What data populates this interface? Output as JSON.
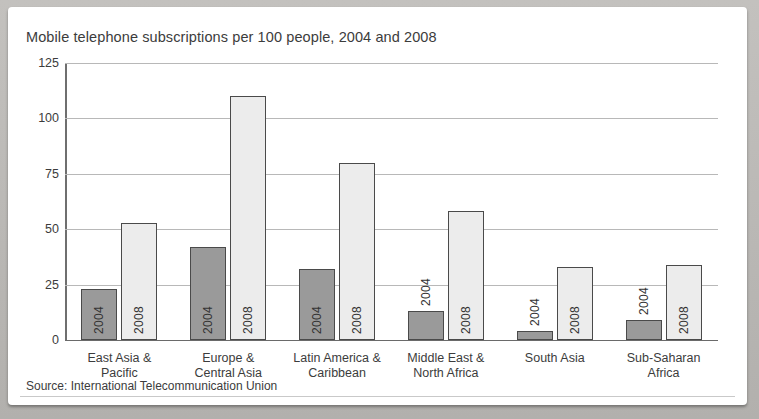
{
  "chart_data": {
    "type": "bar",
    "title": "Mobile telephone subscriptions per 100 people, 2004 and 2008",
    "xlabel": "",
    "ylabel": "",
    "ylim": [
      0,
      125
    ],
    "yticks": [
      0,
      25,
      50,
      75,
      100,
      125
    ],
    "grid": true,
    "legend_position": "none",
    "series_labels_on_bars": true,
    "categories": [
      "East Asia &\nPacific",
      "Europe &\nCentral Asia",
      "Latin America &\nCaribbean",
      "Middle East &\nNorth Africa",
      "South Asia",
      "Sub-Saharan\nAfrica"
    ],
    "category_lines": [
      [
        "East Asia &",
        "Pacific"
      ],
      [
        "Europe &",
        "Central Asia"
      ],
      [
        "Latin America &",
        "Caribbean"
      ],
      [
        "Middle East &",
        "North Africa"
      ],
      [
        "South Asia",
        ""
      ],
      [
        "Sub-Saharan",
        "Africa"
      ]
    ],
    "series": [
      {
        "name": "2004",
        "color": "#9a9a9a",
        "values": [
          23,
          42,
          32,
          13,
          4,
          9
        ]
      },
      {
        "name": "2008",
        "color": "#ececec",
        "values": [
          53,
          110,
          80,
          58,
          33,
          34
        ]
      }
    ]
  },
  "source": {
    "text": "Source: International Telecommunication Union"
  },
  "axis": {
    "tick_labels": [
      "125",
      "100",
      "75",
      "50",
      "25",
      "0"
    ]
  },
  "bar_labels": {
    "y2004": "2004",
    "y2008": "2008"
  }
}
